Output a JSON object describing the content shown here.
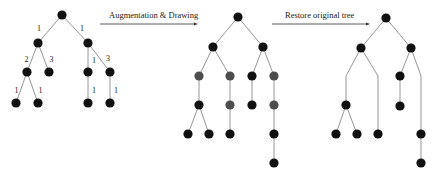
{
  "diagram": {
    "arrows": [
      {
        "label": "Augmentation & Drawing"
      },
      {
        "label": "Restore original tree"
      }
    ],
    "node_colors": {
      "original": "#111111",
      "augmented": "#4d4d4d"
    },
    "trees": [
      {
        "name": "original-tree",
        "nodes": [
          "r",
          "a",
          "b",
          "a1",
          "a2",
          "b1",
          "b2",
          "a1x",
          "a1y",
          "b1x",
          "b2x"
        ],
        "edges": [
          {
            "from": "r",
            "to": "a",
            "label": "1"
          },
          {
            "from": "r",
            "to": "b",
            "label": "1"
          },
          {
            "from": "a",
            "to": "a1",
            "label": "2"
          },
          {
            "from": "a",
            "to": "a2",
            "label": "3"
          },
          {
            "from": "b",
            "to": "b1",
            "label": "1"
          },
          {
            "from": "b",
            "to": "b2",
            "label": "3"
          },
          {
            "from": "a1",
            "to": "a1x",
            "label": "1"
          },
          {
            "from": "a1",
            "to": "a1y",
            "label": "1"
          },
          {
            "from": "b1",
            "to": "b1x",
            "label": "1"
          },
          {
            "from": "b2",
            "to": "b2x",
            "label": "1"
          }
        ]
      },
      {
        "name": "augmented-tree",
        "augmented_nodes": [
          "a1d",
          "a2d1",
          "a2d2",
          "b2d1",
          "b2d2"
        ]
      },
      {
        "name": "restored-tree"
      }
    ]
  }
}
